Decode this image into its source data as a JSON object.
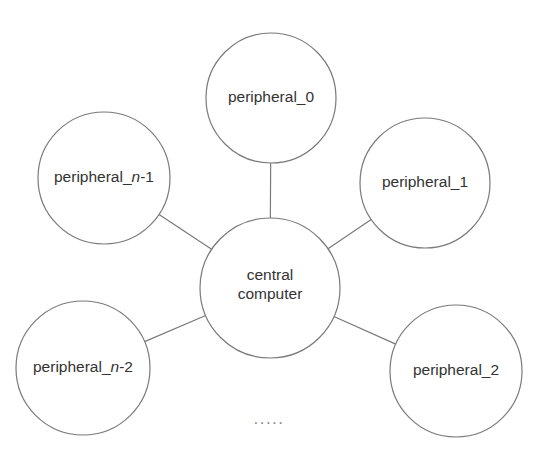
{
  "diagram": {
    "type": "star-topology-network-diagram",
    "canvas": {
      "width": 545,
      "height": 457,
      "background": "#ffffff"
    },
    "style": {
      "node_stroke": "#7a7a7a",
      "node_fill": "#ffffff",
      "node_stroke_width": 1.2,
      "edge_stroke": "#7a7a7a",
      "edge_stroke_width": 1.2,
      "label_color": "#333333",
      "ellipsis_color": "#8a8a8a"
    },
    "center_node": {
      "id": "central-computer",
      "label_line1": "central",
      "label_line2": "computer",
      "cx": 270,
      "cy": 288,
      "r": 70
    },
    "peripheral_nodes": [
      {
        "id": "peripheral-0",
        "label_prefix": "peripheral_0",
        "label_var": "",
        "label_suffix": "",
        "cx": 271,
        "cy": 98,
        "r": 65
      },
      {
        "id": "peripheral-1",
        "label_prefix": "peripheral_1",
        "label_var": "",
        "label_suffix": "",
        "cx": 425,
        "cy": 183,
        "r": 65
      },
      {
        "id": "peripheral-2",
        "label_prefix": "peripheral_2",
        "label_var": "",
        "label_suffix": "",
        "cx": 456,
        "cy": 371,
        "r": 66
      },
      {
        "id": "peripheral-n-minus-2",
        "label_prefix": "peripheral_",
        "label_var": "n",
        "label_suffix": "-2",
        "cx": 83,
        "cy": 368,
        "r": 67
      },
      {
        "id": "peripheral-n-minus-1",
        "label_prefix": "peripheral_",
        "label_var": "n",
        "label_suffix": "-1",
        "cx": 104,
        "cy": 178,
        "r": 66
      }
    ],
    "edges": [
      {
        "id": "edge-center-peripheral-0",
        "from": "central-computer",
        "to": "peripheral-0"
      },
      {
        "id": "edge-center-peripheral-1",
        "from": "central-computer",
        "to": "peripheral-1"
      },
      {
        "id": "edge-center-peripheral-2",
        "from": "central-computer",
        "to": "peripheral-2"
      },
      {
        "id": "edge-center-peripheral-n-minus-2",
        "from": "central-computer",
        "to": "peripheral-n-minus-2"
      },
      {
        "id": "edge-center-peripheral-n-minus-1",
        "from": "central-computer",
        "to": "peripheral-n-minus-1"
      }
    ],
    "ellipsis": {
      "text": ".....",
      "x": 269,
      "y": 424
    }
  }
}
